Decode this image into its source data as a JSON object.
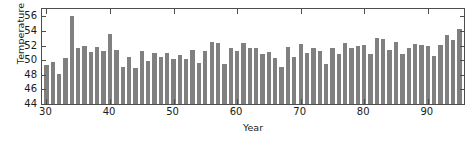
{
  "chart_data": {
    "type": "bar",
    "title": "",
    "subtitle": "",
    "xlabel": "Year",
    "ylabel": "Temperature",
    "xlim": [
      29.3,
      95.7
    ],
    "ylim": [
      44,
      57
    ],
    "xticks": [
      30,
      40,
      50,
      60,
      70,
      80,
      90
    ],
    "yticks": [
      44,
      46,
      48,
      50,
      52,
      54,
      56
    ],
    "grid": false,
    "legend": null,
    "bar_color": "#808080",
    "frame_color": "#4d4d4d",
    "background": "#ffffff",
    "baseline": 44,
    "categories": [
      30,
      31,
      32,
      33,
      34,
      35,
      36,
      37,
      38,
      39,
      40,
      41,
      42,
      43,
      44,
      45,
      46,
      47,
      48,
      49,
      50,
      51,
      52,
      53,
      54,
      55,
      56,
      57,
      58,
      59,
      60,
      61,
      62,
      63,
      64,
      65,
      66,
      67,
      68,
      69,
      70,
      71,
      72,
      73,
      74,
      75,
      76,
      77,
      78,
      79,
      80,
      81,
      82,
      83,
      84,
      85,
      86,
      87,
      88,
      89,
      90,
      91,
      92,
      93,
      94,
      95
    ],
    "values": [
      49.4,
      49.7,
      48.1,
      50.3,
      56.0,
      51.6,
      51.9,
      51.1,
      51.8,
      51.3,
      53.6,
      51.4,
      49.1,
      50.5,
      48.9,
      51.2,
      49.9,
      51.0,
      50.5,
      51.0,
      50.2,
      50.7,
      50.1,
      51.4,
      49.6,
      51.2,
      52.5,
      52.3,
      49.5,
      51.7,
      51.2,
      52.4,
      51.7,
      51.6,
      50.9,
      51.1,
      50.3,
      49.0,
      51.8,
      50.5,
      52.2,
      51.0,
      51.6,
      51.2,
      49.5,
      51.7,
      50.9,
      52.3,
      51.7,
      52.0,
      52.1,
      50.9,
      53.1,
      52.9,
      51.4,
      52.5,
      50.9,
      51.7,
      52.2,
      52.1,
      51.9,
      50.6,
      52.1,
      53.5,
      52.8,
      54.3
    ]
  }
}
